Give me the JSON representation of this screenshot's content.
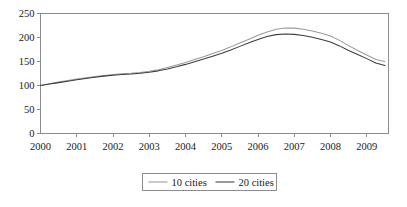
{
  "chart_data": {
    "type": "line",
    "title": "",
    "subtitle": "",
    "xlabel": "",
    "ylabel": "",
    "xlim": [
      2000,
      2009.6
    ],
    "ylim": [
      0,
      250
    ],
    "yticks": [
      0,
      50,
      100,
      150,
      200,
      250
    ],
    "xticks": [
      2000,
      2001,
      2002,
      2003,
      2004,
      2005,
      2006,
      2007,
      2008,
      2009
    ],
    "xtick_labels": [
      "2000",
      "2001",
      "2002",
      "2003",
      "2004",
      "2005",
      "2006",
      "2007",
      "2008",
      "2009"
    ],
    "ytick_labels": [
      "0",
      "50",
      "100",
      "150",
      "200",
      "250"
    ],
    "grid": false,
    "legend_position": "bottom-center",
    "x": [
      2000.0,
      2000.25,
      2000.5,
      2000.75,
      2001.0,
      2001.25,
      2001.5,
      2001.75,
      2002.0,
      2002.25,
      2002.5,
      2002.75,
      2003.0,
      2003.25,
      2003.5,
      2003.75,
      2004.0,
      2004.25,
      2004.5,
      2004.75,
      2005.0,
      2005.25,
      2005.5,
      2005.75,
      2006.0,
      2006.25,
      2006.5,
      2006.75,
      2007.0,
      2007.25,
      2007.5,
      2007.75,
      2008.0,
      2008.25,
      2008.5,
      2008.75,
      2009.0,
      2009.25,
      2009.5
    ],
    "series": [
      {
        "name": "10 cities",
        "color": "#9a9a9a",
        "values": [
          100.0,
          103.5,
          107.0,
          110.5,
          113.5,
          116.0,
          118.5,
          121.0,
          123.0,
          124.5,
          125.5,
          127.0,
          129.5,
          133.0,
          137.5,
          142.5,
          148.0,
          154.0,
          160.0,
          166.5,
          173.0,
          180.5,
          188.5,
          196.5,
          204.5,
          211.5,
          217.0,
          220.0,
          219.5,
          217.0,
          213.5,
          209.0,
          203.0,
          194.0,
          183.0,
          173.0,
          163.5,
          154.0,
          150.0
        ]
      },
      {
        "name": "20 cities",
        "color": "#3c3c3c",
        "values": [
          100.0,
          103.0,
          106.0,
          109.0,
          112.0,
          114.5,
          117.0,
          119.5,
          121.5,
          123.0,
          124.0,
          125.5,
          127.5,
          130.5,
          134.5,
          139.0,
          144.0,
          149.5,
          155.0,
          161.0,
          167.0,
          174.0,
          181.5,
          189.0,
          196.0,
          202.0,
          206.0,
          207.5,
          206.5,
          204.0,
          200.5,
          196.0,
          190.5,
          182.5,
          173.0,
          164.5,
          156.0,
          147.0,
          141.5
        ]
      }
    ],
    "legend": [
      {
        "label": "10 cities",
        "color": "#9a9a9a"
      },
      {
        "label": "20 cities",
        "color": "#3c3c3c"
      }
    ],
    "axis_color": "#8c8c8c",
    "text_color": "#1a1a1a"
  }
}
